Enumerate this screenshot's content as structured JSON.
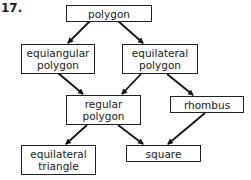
{
  "problem_number": "17.",
  "nodes": {
    "polygon": "polygon",
    "equiangular_polygon": "equiangular polygon",
    "equilateral_polygon": "equilateral polygon",
    "regular_polygon": "regular polygon",
    "rhombus": "rhombus",
    "equilateral_triangle": "equilateral triangle",
    "square": "square"
  },
  "edges": [
    {
      "from": "polygon",
      "to": "equiangular polygon"
    },
    {
      "from": "polygon",
      "to": "equilateral polygon"
    },
    {
      "from": "equiangular polygon",
      "to": "regular polygon"
    },
    {
      "from": "equilateral polygon",
      "to": "regular polygon"
    },
    {
      "from": "equilateral polygon",
      "to": "rhombus"
    },
    {
      "from": "regular polygon",
      "to": "equilateral triangle"
    },
    {
      "from": "regular polygon",
      "to": "square"
    },
    {
      "from": "rhombus",
      "to": "square"
    }
  ],
  "colors": {
    "line": "#111111",
    "box_border": "#222222",
    "background": "#ffffff"
  }
}
